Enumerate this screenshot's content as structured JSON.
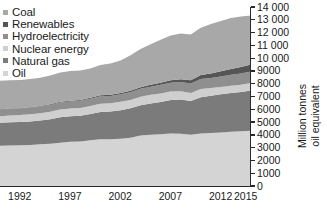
{
  "legend": {
    "position": "top-left",
    "items": [
      {
        "label": "Coal",
        "color": "#a8a8a8"
      },
      {
        "label": "Renewables",
        "color": "#555555"
      },
      {
        "label": "Hydroelectricity",
        "color": "#8f8f8f"
      },
      {
        "label": "Nuclear energy",
        "color": "#cfcfcf"
      },
      {
        "label": "Natural gas",
        "color": "#7b7b7b"
      },
      {
        "label": "Oil",
        "color": "#d4d4d4"
      }
    ]
  },
  "axes": {
    "y_title": "Million tonnes\noil equivalent",
    "y_ticks": [
      "0",
      "1000",
      "2000",
      "3000",
      "4000",
      "5000",
      "6000",
      "7000",
      "8000",
      "9000",
      "10 000",
      "11 000",
      "12 000",
      "13 000",
      "14 000"
    ],
    "x_ticks": [
      "1992",
      "1997",
      "2002",
      "2007",
      "2012",
      "2015"
    ]
  },
  "chart_data": {
    "type": "area",
    "title": "",
    "xlabel": "",
    "ylabel": "Million tonnes oil equivalent",
    "ylim": [
      0,
      14000
    ],
    "xlim": [
      1990,
      2015
    ],
    "grid": false,
    "stacked": true,
    "legend_position": "top-left",
    "x": [
      1990,
      1991,
      1992,
      1993,
      1994,
      1995,
      1996,
      1997,
      1998,
      1999,
      2000,
      2001,
      2002,
      2003,
      2004,
      2005,
      2006,
      2007,
      2008,
      2009,
      2010,
      2011,
      2012,
      2013,
      2014,
      2015
    ],
    "series": [
      {
        "name": "Oil",
        "color": "#d4d4d4",
        "values": [
          3150,
          3160,
          3190,
          3200,
          3260,
          3310,
          3390,
          3470,
          3490,
          3570,
          3650,
          3660,
          3700,
          3780,
          3940,
          4000,
          4040,
          4100,
          4080,
          4010,
          4110,
          4150,
          4190,
          4240,
          4280,
          4330
        ]
      },
      {
        "name": "Natural gas",
        "color": "#7b7b7b",
        "values": [
          1790,
          1820,
          1820,
          1850,
          1860,
          1910,
          1990,
          1990,
          2010,
          2060,
          2140,
          2170,
          2230,
          2310,
          2380,
          2460,
          2530,
          2630,
          2680,
          2630,
          2840,
          2910,
          2990,
          3040,
          3070,
          3140
        ]
      },
      {
        "name": "Nuclear energy",
        "color": "#cfcfcf",
        "values": [
          525,
          540,
          540,
          555,
          570,
          585,
          600,
          600,
          610,
          630,
          640,
          645,
          650,
          645,
          665,
          670,
          670,
          665,
          650,
          635,
          645,
          600,
          560,
          565,
          575,
          583
        ]
      },
      {
        "name": "Hydroelectricity",
        "color": "#8f8f8f",
        "values": [
          490,
          495,
          495,
          510,
          520,
          525,
          545,
          545,
          550,
          565,
          580,
          570,
          590,
          595,
          615,
          640,
          670,
          685,
          720,
          740,
          780,
          790,
          830,
          860,
          880,
          893
        ]
      },
      {
        "name": "Renewables",
        "color": "#555555",
        "values": [
          40,
          42,
          45,
          48,
          52,
          56,
          60,
          64,
          70,
          76,
          84,
          92,
          102,
          114,
          128,
          146,
          168,
          196,
          228,
          258,
          302,
          350,
          400,
          450,
          500,
          550
        ]
      },
      {
        "name": "Coal",
        "color": "#a8a8a8",
        "values": [
          2230,
          2220,
          2200,
          2200,
          2210,
          2250,
          2300,
          2320,
          2300,
          2290,
          2360,
          2440,
          2540,
          2780,
          2990,
          3180,
          3360,
          3500,
          3570,
          3580,
          3700,
          3870,
          3940,
          3980,
          3950,
          3840
        ]
      }
    ]
  }
}
